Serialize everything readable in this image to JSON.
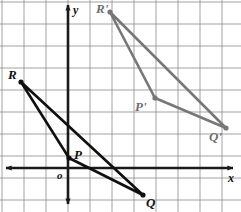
{
  "figure": {
    "width": 241,
    "height": 212,
    "background_color": "#ffffff"
  },
  "grid": {
    "line_color": "#8a8a8a",
    "line_width": 0.8,
    "spacing_px": 22,
    "origin_px": {
      "x": 68,
      "y": 168
    },
    "x_gridlines": [
      2,
      24,
      46,
      68,
      90,
      112,
      134,
      156,
      178,
      200,
      222
    ],
    "y_gridlines": [
      2,
      24,
      46,
      68,
      90,
      112,
      134,
      156,
      178,
      200
    ],
    "visible": true
  },
  "axes": {
    "color": "#1a1a1a",
    "stroke_width": 2.6,
    "x_axis": {
      "label": "x",
      "label_pos": {
        "x": 228,
        "y": 172
      },
      "y_px": 168,
      "x_start_px": 6,
      "x_end_px": 233,
      "arrows": "both"
    },
    "y_axis": {
      "label": "y",
      "label_pos": {
        "x": 73,
        "y": 4
      },
      "x_px": 68,
      "y_start_px": 5,
      "y_end_px": 204,
      "arrows": "both"
    },
    "origin_label": "o",
    "origin_label_pos": {
      "x": 57,
      "y": 170
    }
  },
  "shapes": [
    {
      "name": "triangle-pqr",
      "kind": "triangle",
      "color": "#101010",
      "stroke_width": 2.6,
      "vertex_dot_radius": 2.6,
      "vertices": [
        {
          "label": "P",
          "px": {
            "x": 69,
            "y": 158
          },
          "label_px": {
            "x": 74,
            "y": 148
          }
        },
        {
          "label": "Q",
          "px": {
            "x": 143,
            "y": 195
          },
          "label_px": {
            "x": 146,
            "y": 196
          }
        },
        {
          "label": "R",
          "px": {
            "x": 21,
            "y": 82
          },
          "label_px": {
            "x": 8,
            "y": 68
          }
        }
      ]
    },
    {
      "name": "triangle-pqr-image",
      "kind": "triangle",
      "color": "#777777",
      "stroke_width": 2.6,
      "vertex_dot_radius": 2.6,
      "vertices": [
        {
          "label": "P'",
          "px": {
            "x": 155,
            "y": 98
          },
          "label_px": {
            "x": 135,
            "y": 100
          }
        },
        {
          "label": "Q'",
          "px": {
            "x": 226,
            "y": 128
          },
          "label_px": {
            "x": 209,
            "y": 130
          }
        },
        {
          "label": "R'",
          "px": {
            "x": 110,
            "y": 12
          },
          "label_px": {
            "x": 96,
            "y": 2
          }
        }
      ]
    }
  ]
}
